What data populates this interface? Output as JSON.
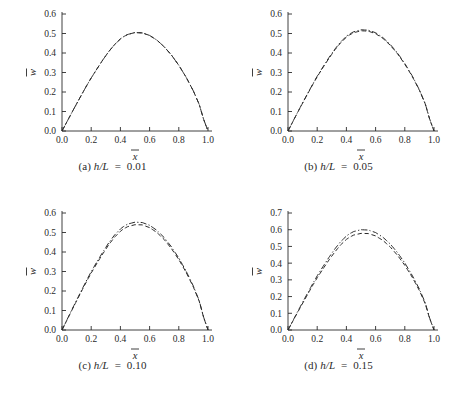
{
  "figure": {
    "background": "#ffffff",
    "ink": "#2a2a2a",
    "panel_count": 4
  },
  "panels": [
    {
      "key": "a",
      "caption_tag": "(a)",
      "caption_var": "h/L",
      "caption_eq": "=",
      "caption_value": "0.01",
      "caption_full": "(a) h/L  =  0.01"
    },
    {
      "key": "b",
      "caption_tag": "(b)",
      "caption_var": "h/L",
      "caption_eq": "=",
      "caption_value": "0.05",
      "caption_full": "(b) h/L  =  0.05"
    },
    {
      "key": "c",
      "caption_tag": "(c)",
      "caption_var": "h/L",
      "caption_eq": "=",
      "caption_value": "0.10",
      "caption_full": "(c) h/L  =  0.10"
    },
    {
      "key": "d",
      "caption_tag": "(d)",
      "caption_var": "h/L",
      "caption_eq": "=",
      "caption_value": "0.15",
      "caption_full": "(d) h/L  =  0.15"
    }
  ],
  "chart_data": [
    {
      "id": "panel-a",
      "type": "line",
      "title": "(a) h/L = 0.01",
      "xlabel": "x̄",
      "ylabel": "w̄",
      "xlim": [
        0.0,
        1.0
      ],
      "ylim": [
        0.0,
        0.6
      ],
      "xticks": [
        0.0,
        0.2,
        0.4,
        0.6,
        0.8,
        1.0
      ],
      "xticklabels": [
        "0.0",
        "0.2",
        "0.4",
        "0.6",
        "0.8",
        "1.0"
      ],
      "yticks": [
        0.0,
        0.1,
        0.2,
        0.3,
        0.4,
        0.5,
        0.6
      ],
      "yticklabels": [
        "0.0",
        "0.1",
        "0.2",
        "0.3",
        "0.4",
        "0.5",
        "0.6"
      ],
      "grid": false,
      "legend": "none",
      "x": [
        0.0,
        0.02,
        0.05,
        0.08,
        0.11,
        0.14,
        0.17,
        0.2,
        0.24,
        0.28,
        0.32,
        0.36,
        0.4,
        0.42,
        0.45,
        0.5,
        0.55,
        0.6,
        0.65,
        0.7,
        0.75,
        0.8,
        0.85,
        0.9,
        0.94,
        0.97,
        1.0
      ],
      "series": [
        {
          "name": "curve-1",
          "style": "dashed",
          "values": [
            0.0,
            0.028,
            0.07,
            0.112,
            0.153,
            0.194,
            0.234,
            0.272,
            0.319,
            0.365,
            0.407,
            0.443,
            0.472,
            0.483,
            0.495,
            0.505,
            0.503,
            0.49,
            0.466,
            0.432,
            0.389,
            0.337,
            0.276,
            0.205,
            0.136,
            0.06,
            0.0
          ]
        },
        {
          "name": "curve-2",
          "style": "dash-dot",
          "values": [
            0.0,
            0.028,
            0.07,
            0.112,
            0.153,
            0.194,
            0.234,
            0.272,
            0.319,
            0.365,
            0.407,
            0.443,
            0.472,
            0.483,
            0.495,
            0.505,
            0.503,
            0.49,
            0.466,
            0.432,
            0.389,
            0.337,
            0.276,
            0.205,
            0.136,
            0.06,
            0.0
          ]
        }
      ],
      "peak_value": 0.545,
      "peak_x": 0.42
    },
    {
      "id": "panel-b",
      "type": "line",
      "title": "(b) h/L = 0.05",
      "xlabel": "x̄",
      "ylabel": "w̄",
      "xlim": [
        0.0,
        1.0
      ],
      "ylim": [
        0.0,
        0.6
      ],
      "xticks": [
        0.0,
        0.2,
        0.4,
        0.6,
        0.8,
        1.0
      ],
      "xticklabels": [
        "0.0",
        "0.2",
        "0.4",
        "0.6",
        "0.8",
        "1.0"
      ],
      "yticks": [
        0.0,
        0.1,
        0.2,
        0.3,
        0.4,
        0.5,
        0.6
      ],
      "yticklabels": [
        "0.0",
        "0.1",
        "0.2",
        "0.3",
        "0.4",
        "0.5",
        "0.6"
      ],
      "grid": false,
      "legend": "none",
      "x": [
        0.0,
        0.02,
        0.05,
        0.08,
        0.11,
        0.14,
        0.17,
        0.2,
        0.24,
        0.28,
        0.32,
        0.36,
        0.4,
        0.42,
        0.45,
        0.5,
        0.55,
        0.6,
        0.65,
        0.7,
        0.75,
        0.8,
        0.85,
        0.9,
        0.94,
        0.97,
        1.0
      ],
      "series": [
        {
          "name": "curve-1",
          "style": "dashed",
          "values": [
            0.0,
            0.029,
            0.072,
            0.115,
            0.157,
            0.198,
            0.239,
            0.278,
            0.326,
            0.372,
            0.415,
            0.452,
            0.481,
            0.492,
            0.504,
            0.514,
            0.512,
            0.499,
            0.475,
            0.44,
            0.396,
            0.343,
            0.281,
            0.209,
            0.139,
            0.061,
            0.0
          ]
        },
        {
          "name": "curve-2",
          "style": "dash-dot",
          "values": [
            0.0,
            0.029,
            0.073,
            0.116,
            0.158,
            0.2,
            0.241,
            0.281,
            0.329,
            0.376,
            0.419,
            0.456,
            0.486,
            0.497,
            0.509,
            0.519,
            0.517,
            0.504,
            0.479,
            0.444,
            0.4,
            0.346,
            0.284,
            0.211,
            0.14,
            0.062,
            0.0
          ]
        }
      ],
      "peak_value": 0.555,
      "peak_x": 0.42
    },
    {
      "id": "panel-c",
      "type": "line",
      "title": "(c) h/L = 0.10",
      "xlabel": "x̄",
      "ylabel": "w̄",
      "xlim": [
        0.0,
        1.0
      ],
      "ylim": [
        0.0,
        0.6
      ],
      "xticks": [
        0.0,
        0.2,
        0.4,
        0.6,
        0.8,
        1.0
      ],
      "xticklabels": [
        "0.0",
        "0.2",
        "0.4",
        "0.6",
        "0.8",
        "1.0"
      ],
      "yticks": [
        0.0,
        0.1,
        0.2,
        0.3,
        0.4,
        0.5,
        0.6
      ],
      "yticklabels": [
        "0.0",
        "0.1",
        "0.2",
        "0.3",
        "0.4",
        "0.5",
        "0.6"
      ],
      "grid": false,
      "legend": "none",
      "x": [
        0.0,
        0.02,
        0.05,
        0.08,
        0.11,
        0.14,
        0.17,
        0.2,
        0.24,
        0.28,
        0.32,
        0.36,
        0.4,
        0.42,
        0.45,
        0.5,
        0.55,
        0.6,
        0.65,
        0.7,
        0.75,
        0.8,
        0.85,
        0.9,
        0.94,
        0.97,
        1.0
      ],
      "series": [
        {
          "name": "curve-1",
          "style": "dash-dot",
          "values": [
            0.0,
            0.031,
            0.077,
            0.123,
            0.168,
            0.213,
            0.257,
            0.299,
            0.351,
            0.4,
            0.447,
            0.487,
            0.518,
            0.53,
            0.543,
            0.553,
            0.551,
            0.537,
            0.511,
            0.474,
            0.426,
            0.369,
            0.302,
            0.225,
            0.15,
            0.066,
            0.0
          ]
        },
        {
          "name": "curve-2",
          "style": "dashed",
          "values": [
            0.0,
            0.03,
            0.075,
            0.12,
            0.164,
            0.208,
            0.251,
            0.292,
            0.343,
            0.391,
            0.437,
            0.476,
            0.506,
            0.518,
            0.53,
            0.54,
            0.539,
            0.525,
            0.5,
            0.464,
            0.417,
            0.361,
            0.296,
            0.22,
            0.147,
            0.065,
            0.0
          ]
        }
      ],
      "peak_value": 0.588,
      "peak_value_secondary": 0.572,
      "peak_x": 0.42
    },
    {
      "id": "panel-d",
      "type": "line",
      "title": "(d) h/L = 0.15",
      "xlabel": "x̄",
      "ylabel": "w̄",
      "xlim": [
        0.0,
        1.0
      ],
      "ylim": [
        0.0,
        0.7
      ],
      "xticks": [
        0.0,
        0.2,
        0.4,
        0.6,
        0.8,
        1.0
      ],
      "xticklabels": [
        "0.0",
        "0.2",
        "0.4",
        "0.6",
        "0.8",
        "1.0"
      ],
      "yticks": [
        0.0,
        0.1,
        0.2,
        0.3,
        0.4,
        0.5,
        0.6,
        0.7
      ],
      "yticklabels": [
        "0.0",
        "0.1",
        "0.2",
        "0.3",
        "0.4",
        "0.5",
        "0.6",
        "0.7"
      ],
      "grid": false,
      "legend": "none",
      "x": [
        0.0,
        0.02,
        0.05,
        0.08,
        0.11,
        0.14,
        0.17,
        0.2,
        0.24,
        0.28,
        0.32,
        0.36,
        0.4,
        0.42,
        0.45,
        0.5,
        0.55,
        0.6,
        0.65,
        0.7,
        0.75,
        0.8,
        0.85,
        0.9,
        0.94,
        0.97,
        1.0
      ],
      "series": [
        {
          "name": "curve-1",
          "style": "dash-dot",
          "values": [
            0.0,
            0.033,
            0.083,
            0.133,
            0.182,
            0.23,
            0.278,
            0.324,
            0.38,
            0.434,
            0.484,
            0.528,
            0.562,
            0.575,
            0.589,
            0.6,
            0.598,
            0.583,
            0.555,
            0.515,
            0.463,
            0.401,
            0.328,
            0.245,
            0.163,
            0.072,
            0.0
          ]
        },
        {
          "name": "curve-2",
          "style": "dashed",
          "values": [
            0.0,
            0.032,
            0.08,
            0.128,
            0.175,
            0.222,
            0.268,
            0.312,
            0.366,
            0.418,
            0.466,
            0.509,
            0.542,
            0.554,
            0.568,
            0.578,
            0.577,
            0.563,
            0.536,
            0.497,
            0.447,
            0.387,
            0.317,
            0.236,
            0.157,
            0.069,
            0.0
          ]
        }
      ],
      "peak_value": 0.635,
      "peak_value_secondary": 0.613,
      "peak_x": 0.43
    }
  ]
}
